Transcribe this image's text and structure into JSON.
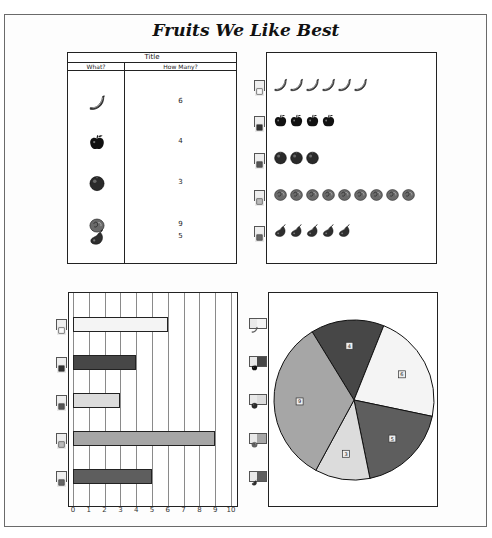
{
  "page": {
    "title": "Fruits We Like Best"
  },
  "table": {
    "title": "Title",
    "headers": [
      "What?",
      "How Many?"
    ],
    "rows": [
      {
        "fruit": "banana",
        "icon": "banana-icon",
        "value": "6"
      },
      {
        "fruit": "apple",
        "icon": "apple-icon",
        "value": "4"
      },
      {
        "fruit": "orange",
        "icon": "orange-icon",
        "value": "3"
      },
      {
        "fruit": "peach",
        "icon": "peach-icon",
        "value": "9"
      },
      {
        "fruit": "pear",
        "icon": "pear-icon",
        "value": "5"
      }
    ]
  },
  "colors": {
    "banana": "#f4f4f4",
    "apple": "#474747",
    "orange": "#dcdcdc",
    "peach": "#a6a6a6",
    "pear": "#5e5e5e",
    "border": "#222222",
    "grid": "#8a8a8a"
  },
  "chart_data": [
    {
      "type": "table",
      "title": "Title",
      "columns": [
        "What?",
        "How Many?"
      ],
      "rows": [
        [
          "banana",
          6
        ],
        [
          "apple",
          4
        ],
        [
          "orange",
          3
        ],
        [
          "peach",
          9
        ],
        [
          "pear",
          5
        ]
      ]
    },
    {
      "type": "pictograph",
      "categories": [
        "banana",
        "apple",
        "orange",
        "peach",
        "pear"
      ],
      "values": [
        6,
        4,
        3,
        9,
        5
      ]
    },
    {
      "type": "bar",
      "orientation": "horizontal",
      "categories": [
        "banana",
        "apple",
        "orange",
        "peach",
        "pear"
      ],
      "values": [
        6,
        4,
        3,
        9,
        5
      ],
      "xlim": [
        0,
        10
      ],
      "xticks": [
        "0",
        "1",
        "2",
        "3",
        "4",
        "5",
        "6",
        "7",
        "8",
        "9",
        "10"
      ],
      "grid": true,
      "legend_position": "left"
    },
    {
      "type": "pie",
      "categories": [
        "apple",
        "banana",
        "pear",
        "orange",
        "peach"
      ],
      "values": [
        4,
        6,
        5,
        3,
        9
      ],
      "slice_labels": [
        "4",
        "6",
        "5",
        "3",
        "9"
      ],
      "legend_position": "left"
    }
  ],
  "pie_legend": [
    "banana",
    "apple",
    "orange",
    "peach",
    "pear"
  ]
}
